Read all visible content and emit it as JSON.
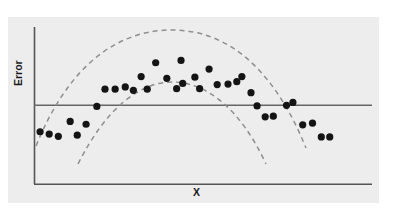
{
  "figure": {
    "title": "",
    "panel_color": "#ededed",
    "background_color": "#ffffff",
    "axis_color": "#555555",
    "dot_color": "#141414",
    "band_color": "#8c8c8c"
  },
  "labels": {
    "ylabel": "Error",
    "xlabel": "X"
  },
  "chart_data": {
    "type": "scatter",
    "title": "",
    "xlabel": "X",
    "ylabel": "Error",
    "xlim": [
      0,
      100
    ],
    "ylim": [
      -100,
      100
    ],
    "grid": false,
    "legend": null,
    "reference_line": {
      "name": "zero-error-line",
      "orientation": "horizontal",
      "y": 0,
      "style": "solid",
      "color": "#555555"
    },
    "annotations": [
      "Scatter of residual error versus X showing a systematic inverted-U (quadratic) pattern rather than random scatter about zero.",
      "Two dashed guide curves trace the upper and lower envelope of the curved point band."
    ],
    "series": [
      {
        "name": "error-points",
        "type": "scatter",
        "marker": "filled-circle",
        "color": "#141414",
        "points": [
          {
            "x": 1.8,
            "y": -46
          },
          {
            "x": 4.5,
            "y": -50
          },
          {
            "x": 7.2,
            "y": -54
          },
          {
            "x": 12.8,
            "y": -52
          },
          {
            "x": 10.7,
            "y": -28
          },
          {
            "x": 15.4,
            "y": -33
          },
          {
            "x": 18.6,
            "y": -2
          },
          {
            "x": 21.0,
            "y": 28
          },
          {
            "x": 24.0,
            "y": 28
          },
          {
            "x": 27.0,
            "y": 32
          },
          {
            "x": 29.4,
            "y": 26
          },
          {
            "x": 31.7,
            "y": 50
          },
          {
            "x": 33.5,
            "y": 28
          },
          {
            "x": 36.0,
            "y": 74
          },
          {
            "x": 39.3,
            "y": 47
          },
          {
            "x": 42.2,
            "y": 29
          },
          {
            "x": 44.0,
            "y": 38
          },
          {
            "x": 43.5,
            "y": 78
          },
          {
            "x": 47.6,
            "y": 49
          },
          {
            "x": 49.0,
            "y": 29
          },
          {
            "x": 51.8,
            "y": 63
          },
          {
            "x": 54.2,
            "y": 36
          },
          {
            "x": 57.4,
            "y": 37
          },
          {
            "x": 60.0,
            "y": 41
          },
          {
            "x": 61.5,
            "y": 50
          },
          {
            "x": 64.2,
            "y": 22
          },
          {
            "x": 66.0,
            "y": -1
          },
          {
            "x": 68.4,
            "y": -20
          },
          {
            "x": 70.8,
            "y": -19
          },
          {
            "x": 74.7,
            "y": 0
          },
          {
            "x": 76.6,
            "y": 5
          },
          {
            "x": 79.5,
            "y": -34
          },
          {
            "x": 82.4,
            "y": -31
          },
          {
            "x": 85.0,
            "y": -55
          },
          {
            "x": 87.5,
            "y": -55
          }
        ]
      },
      {
        "name": "upper-envelope-curve",
        "type": "line",
        "style": "dashed",
        "color": "#8c8c8c",
        "description": "Dashed inverted parabola tracing the top of the error band"
      },
      {
        "name": "lower-envelope-curve",
        "type": "line",
        "style": "dashed",
        "color": "#8c8c8c",
        "description": "Dashed inverted parabola tracing the bottom of the error band"
      }
    ]
  }
}
